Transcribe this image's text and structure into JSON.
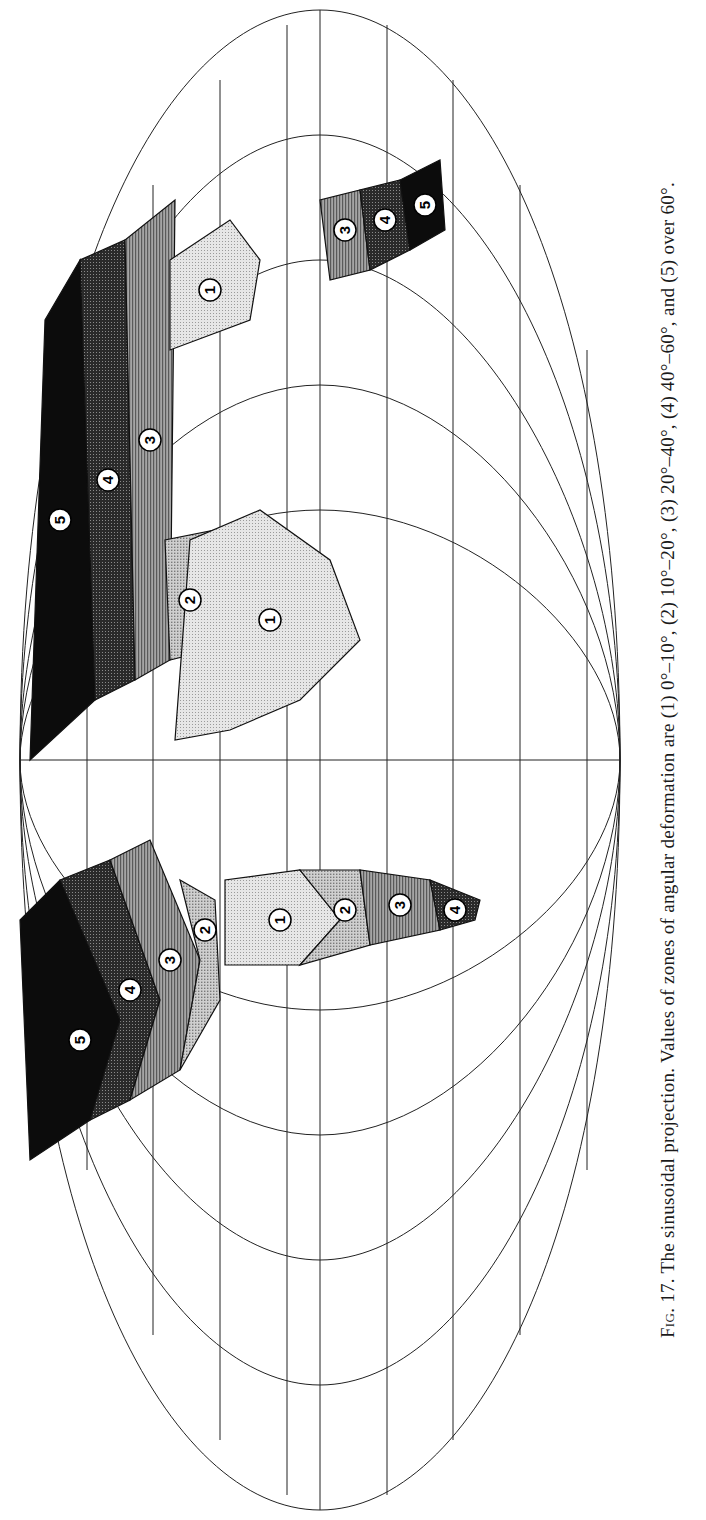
{
  "figure": {
    "number_label": "Fig. 17.",
    "title": "The sinusoidal projection.",
    "caption_body": "Values of zones of angular deformation are (1) 0°–10°, (2) 10°–20°, (3) 20°–40°, (4) 40°–60°, and (5) over 60°.",
    "orientation": "rotated 90° counter-clockwise on page"
  },
  "legend": {
    "zones": [
      {
        "id": "1",
        "range": "0°–10°",
        "shade": "#dedede"
      },
      {
        "id": "2",
        "range": "10°–20°",
        "shade": "#c4c4c4"
      },
      {
        "id": "3",
        "range": "20°–40°",
        "shade": "#8c8c8c"
      },
      {
        "id": "4",
        "range": "40°–60°",
        "shade": "#3c3c3c"
      },
      {
        "id": "5",
        "range": "over 60°",
        "shade": "#0c0c0c"
      }
    ]
  },
  "map": {
    "projection": "sinusoidal",
    "graticule": {
      "parallels_count": 9,
      "meridians_count": 13
    },
    "zone_markers": [
      {
        "continent": "North America",
        "zones": [
          "5",
          "4",
          "3",
          "2"
        ]
      },
      {
        "continent": "South America",
        "zones": [
          "1",
          "2",
          "3",
          "4"
        ]
      },
      {
        "continent": "Europe/Asia",
        "zones": [
          "5",
          "4",
          "3",
          "2"
        ]
      },
      {
        "continent": "Africa",
        "zones": [
          "1"
        ]
      },
      {
        "continent": "Southeast Asia",
        "zones": [
          "1"
        ]
      },
      {
        "continent": "Australia",
        "zones": [
          "3",
          "4",
          "5"
        ]
      }
    ]
  }
}
